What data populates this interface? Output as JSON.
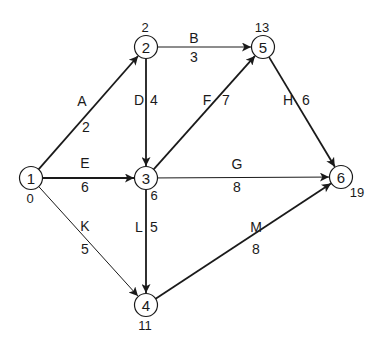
{
  "diagram": {
    "type": "activity-on-arrow network",
    "nodes": [
      {
        "id": "1",
        "label": "1",
        "x": 31,
        "y": 178,
        "time": "0",
        "time_dx": -1,
        "time_dy": 20
      },
      {
        "id": "2",
        "label": "2",
        "x": 146,
        "y": 47,
        "time": "2",
        "time_dx": -1,
        "time_dy": -20
      },
      {
        "id": "3",
        "label": "3",
        "x": 146,
        "y": 178,
        "time": "6",
        "time_dx": 8,
        "time_dy": 17
      },
      {
        "id": "4",
        "label": "4",
        "x": 146,
        "y": 305,
        "time": "11",
        "time_dx": -1,
        "time_dy": 20
      },
      {
        "id": "5",
        "label": "5",
        "x": 263,
        "y": 47,
        "time": "13",
        "time_dx": -1,
        "time_dy": -20
      },
      {
        "id": "6",
        "label": "6",
        "x": 341,
        "y": 177,
        "time": "19",
        "time_dx": 16,
        "time_dy": 15
      }
    ],
    "edges": [
      {
        "activity": "A",
        "duration": "2",
        "from": "1",
        "to": "2",
        "weight": 1.8,
        "name_pos": [
          82,
          101
        ],
        "dur_pos": [
          86,
          127
        ]
      },
      {
        "activity": "B",
        "duration": "3",
        "from": "2",
        "to": "5",
        "weight": 1.0,
        "name_pos": [
          194,
          38
        ],
        "dur_pos": [
          194,
          57
        ]
      },
      {
        "activity": "D",
        "duration": "4",
        "from": "2",
        "to": "3",
        "weight": 1.8,
        "name_pos": [
          139,
          100
        ],
        "dur_pos": [
          154,
          100
        ]
      },
      {
        "activity": "E",
        "duration": "6",
        "from": "1",
        "to": "3",
        "weight": 1.8,
        "name_pos": [
          85,
          163
        ],
        "dur_pos": [
          85,
          187
        ]
      },
      {
        "activity": "F",
        "duration": "7",
        "from": "3",
        "to": "5",
        "weight": 1.8,
        "name_pos": [
          207,
          100
        ],
        "dur_pos": [
          226,
          100
        ]
      },
      {
        "activity": "G",
        "duration": "8",
        "from": "3",
        "to": "6",
        "weight": 1.0,
        "name_pos": [
          237,
          164
        ],
        "dur_pos": [
          237,
          187
        ]
      },
      {
        "activity": "H",
        "duration": "6",
        "from": "5",
        "to": "6",
        "weight": 1.8,
        "name_pos": [
          288,
          100
        ],
        "dur_pos": [
          306,
          100
        ]
      },
      {
        "activity": "K",
        "duration": "5",
        "from": "1",
        "to": "4",
        "weight": 1.0,
        "name_pos": [
          85,
          226
        ],
        "dur_pos": [
          85,
          249
        ]
      },
      {
        "activity": "L",
        "duration": "5",
        "from": "3",
        "to": "4",
        "weight": 1.8,
        "name_pos": [
          139,
          227
        ],
        "dur_pos": [
          154,
          227
        ]
      },
      {
        "activity": "M",
        "duration": "8",
        "from": "4",
        "to": "6",
        "weight": 1.8,
        "name_pos": [
          256,
          227
        ],
        "dur_pos": [
          256,
          249
        ]
      }
    ]
  }
}
